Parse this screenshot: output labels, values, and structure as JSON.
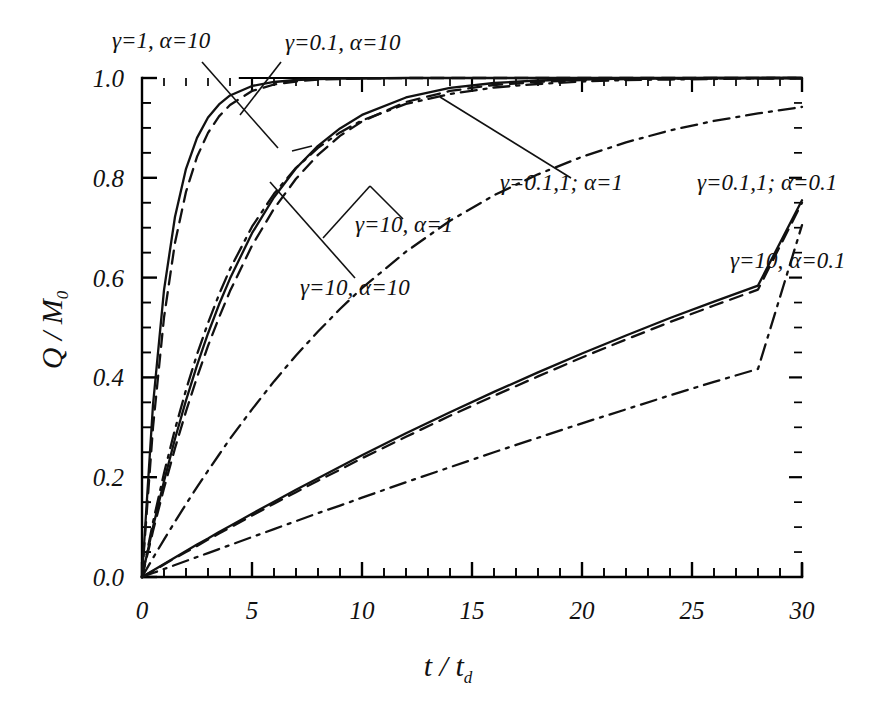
{
  "chart_data": {
    "type": "line",
    "title": "",
    "xlabel": "t / td",
    "ylabel": "Q / M0",
    "xlim": [
      0,
      30
    ],
    "ylim": [
      0,
      1.0
    ],
    "xticks": [
      0,
      5,
      10,
      15,
      20,
      25,
      30
    ],
    "xtick_labels": [
      "0",
      "5",
      "10",
      "15",
      "20",
      "25",
      "30"
    ],
    "yticks": [
      0.0,
      0.2,
      0.4,
      0.6,
      0.8,
      1.0
    ],
    "ytick_labels": [
      "0.0",
      "0.2",
      "0.4",
      "0.6",
      "0.8",
      "1.0"
    ],
    "x_minor_step": 1,
    "y_minor_step": 0.05,
    "grid": false,
    "legend": "annotations-with-leader-lines",
    "x": [
      0,
      0.5,
      1,
      1.5,
      2,
      2.5,
      3,
      3.5,
      4,
      5,
      6,
      7,
      8,
      9,
      10,
      12,
      14,
      16,
      18,
      20,
      22,
      24,
      26,
      28,
      30
    ],
    "series": [
      {
        "name": "gamma=0.1, alpha=10",
        "gamma": 0.1,
        "alpha": 10,
        "style": "solid",
        "values": [
          0,
          0.345,
          0.575,
          0.722,
          0.818,
          0.88,
          0.921,
          0.947,
          0.965,
          0.984,
          0.992,
          0.996,
          0.998,
          0.999,
          0.999,
          1.0,
          1.0,
          1.0,
          1.0,
          1.0,
          1.0,
          1.0,
          1.0,
          1.0,
          1.0
        ]
      },
      {
        "name": "gamma=1, alpha=10",
        "gamma": 1,
        "alpha": 10,
        "style": "dashed",
        "values": [
          0,
          0.3,
          0.52,
          0.67,
          0.772,
          0.842,
          0.89,
          0.923,
          0.946,
          0.974,
          0.987,
          0.993,
          0.997,
          0.998,
          0.999,
          1.0,
          1.0,
          1.0,
          1.0,
          1.0,
          1.0,
          1.0,
          1.0,
          1.0,
          1.0
        ]
      },
      {
        "name": "gamma=10, alpha=10",
        "gamma": 10,
        "alpha": 10,
        "style": "dashdot",
        "values": [
          0,
          0.11,
          0.208,
          0.296,
          0.375,
          0.446,
          0.509,
          0.566,
          0.617,
          0.702,
          0.768,
          0.82,
          0.86,
          0.891,
          0.915,
          0.948,
          0.968,
          0.981,
          0.988,
          0.993,
          0.996,
          0.997,
          0.998,
          0.999,
          0.999
        ]
      },
      {
        "name": "gamma=0.1, alpha=1 (a)",
        "gamma": 0.1,
        "alpha": 1,
        "style": "solid",
        "values": [
          0,
          0.1,
          0.192,
          0.277,
          0.354,
          0.424,
          0.488,
          0.546,
          0.598,
          0.689,
          0.761,
          0.819,
          0.864,
          0.899,
          0.926,
          0.961,
          0.98,
          0.99,
          0.995,
          0.997,
          0.999,
          0.999,
          1.0,
          1.0,
          1.0
        ]
      },
      {
        "name": "gamma=1, alpha=1 (b)",
        "gamma": 1,
        "alpha": 1,
        "style": "dashed",
        "values": [
          0,
          0.092,
          0.178,
          0.258,
          0.332,
          0.4,
          0.463,
          0.52,
          0.573,
          0.664,
          0.738,
          0.798,
          0.846,
          0.884,
          0.913,
          0.952,
          0.974,
          0.986,
          0.992,
          0.996,
          0.998,
          0.999,
          0.999,
          1.0,
          1.0
        ]
      },
      {
        "name": "gamma=10, alpha=1",
        "gamma": 10,
        "alpha": 1,
        "style": "dashdot",
        "values": [
          0,
          0.038,
          0.075,
          0.111,
          0.146,
          0.18,
          0.213,
          0.245,
          0.277,
          0.336,
          0.392,
          0.444,
          0.492,
          0.537,
          0.579,
          0.652,
          0.714,
          0.765,
          0.807,
          0.842,
          0.871,
          0.895,
          0.914,
          0.929,
          0.942
        ]
      },
      {
        "name": "gamma=0.1, alpha=0.1 (a)",
        "gamma": 0.1,
        "alpha": 0.1,
        "style": "solid",
        "values": [
          0,
          0.013,
          0.026,
          0.039,
          0.052,
          0.065,
          0.077,
          0.09,
          0.102,
          0.127,
          0.151,
          0.175,
          0.198,
          0.221,
          0.244,
          0.288,
          0.33,
          0.371,
          0.41,
          0.448,
          0.484,
          0.519,
          0.552,
          0.584,
          0.755
        ]
      },
      {
        "name": "gamma=1, alpha=0.1 (b)",
        "gamma": 1,
        "alpha": 0.1,
        "style": "dashed",
        "values": [
          0,
          0.012,
          0.025,
          0.038,
          0.05,
          0.062,
          0.075,
          0.087,
          0.099,
          0.123,
          0.147,
          0.17,
          0.193,
          0.215,
          0.238,
          0.281,
          0.323,
          0.363,
          0.402,
          0.44,
          0.476,
          0.511,
          0.544,
          0.576,
          0.75
        ]
      },
      {
        "name": "gamma=10, alpha=0.1",
        "gamma": 10,
        "alpha": 0.1,
        "style": "dashdot",
        "values": [
          0,
          0.008,
          0.016,
          0.024,
          0.032,
          0.04,
          0.048,
          0.056,
          0.064,
          0.08,
          0.096,
          0.112,
          0.128,
          0.143,
          0.159,
          0.19,
          0.22,
          0.25,
          0.279,
          0.308,
          0.336,
          0.364,
          0.391,
          0.417,
          0.705
        ]
      }
    ],
    "annotations": [
      {
        "id": "ann-g1-a10",
        "text": "γ=1, α=10",
        "x_px": 112,
        "y_px": 48
      },
      {
        "id": "ann-g01-a10",
        "text": "γ=0.1, α=10",
        "x_px": 285,
        "y_px": 50
      },
      {
        "id": "ann-g011-a1",
        "text": "γ=0.1,1; α=1",
        "x_px": 500,
        "y_px": 190
      },
      {
        "id": "ann-g10-a1",
        "text": "γ=10, α=1",
        "x_px": 355,
        "y_px": 232
      },
      {
        "id": "ann-g10-a10",
        "text": "γ=10, α=10",
        "x_px": 300,
        "y_px": 295
      },
      {
        "id": "ann-g011-a01",
        "text": "γ=0.1,1; α=0.1",
        "x_px": 697,
        "y_px": 190
      },
      {
        "id": "ann-g10-a01",
        "text": "γ=10, α=0.1",
        "x_px": 730,
        "y_px": 268
      }
    ]
  },
  "axis": {
    "y_label_main": "Q / M",
    "y_label_sub": "0",
    "x_label_main": "t / t",
    "x_label_sub": "d"
  },
  "colors": {
    "curve": "#111111",
    "axis": "#000000",
    "background": "#ffffff"
  }
}
